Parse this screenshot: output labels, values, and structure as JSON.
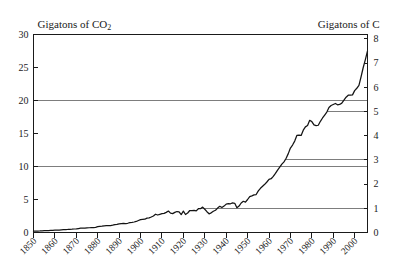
{
  "chart_data": {
    "type": "line",
    "title": "",
    "xlabel": "",
    "ylabel": "Gigatons of CO2",
    "ylabel_right": "Gigatons of C",
    "left_axis": {
      "label": "Gigatons of CO2",
      "unit": "Gigatons of CO2",
      "ticks": [
        0,
        5,
        10,
        15,
        20,
        25,
        30
      ],
      "tick_labels": [
        "0",
        "5",
        "10",
        "15",
        "20",
        "25",
        "30"
      ],
      "ylim": [
        0,
        30
      ]
    },
    "right_axis": {
      "label": "Gigatons of C",
      "unit": "Gigatons of C",
      "ticks": [
        0,
        1,
        2,
        3,
        4,
        5,
        6,
        7,
        8
      ],
      "tick_labels": [
        "0",
        "1",
        "2",
        "3",
        "4",
        "5",
        "6",
        "7",
        "8"
      ],
      "ylim": [
        0,
        8.18
      ]
    },
    "x": {
      "ticks": [
        1850,
        1860,
        1870,
        1880,
        1890,
        1900,
        1910,
        1920,
        1930,
        1940,
        1950,
        1960,
        1970,
        1980,
        1990,
        2000
      ],
      "tick_labels": [
        "1850",
        "1860",
        "1870",
        "1880",
        "1890",
        "1900",
        "1910",
        "1920",
        "1930",
        "1940",
        "1950",
        "1960",
        "1970",
        "1980",
        "1990",
        "2000"
      ],
      "xlim": [
        1850,
        2006
      ]
    },
    "grid": {
      "enabled": true,
      "full_width_levels_co2": [
        10,
        20
      ],
      "partial_levels_carbon": [
        1,
        3,
        5
      ]
    },
    "legend": {
      "entries": [],
      "position": "none"
    },
    "series": [
      {
        "name": "Global CO2 emissions",
        "units": "Gigatons of CO2",
        "points": [
          [
            1850,
            0.2
          ],
          [
            1851,
            0.21
          ],
          [
            1852,
            0.22
          ],
          [
            1853,
            0.23
          ],
          [
            1854,
            0.26
          ],
          [
            1855,
            0.28
          ],
          [
            1856,
            0.29
          ],
          [
            1857,
            0.3
          ],
          [
            1858,
            0.32
          ],
          [
            1859,
            0.33
          ],
          [
            1860,
            0.35
          ],
          [
            1861,
            0.36
          ],
          [
            1862,
            0.37
          ],
          [
            1863,
            0.4
          ],
          [
            1864,
            0.42
          ],
          [
            1865,
            0.44
          ],
          [
            1866,
            0.46
          ],
          [
            1867,
            0.49
          ],
          [
            1868,
            0.5
          ],
          [
            1869,
            0.53
          ],
          [
            1870,
            0.55
          ],
          [
            1871,
            0.6
          ],
          [
            1872,
            0.65
          ],
          [
            1873,
            0.68
          ],
          [
            1874,
            0.66
          ],
          [
            1875,
            0.71
          ],
          [
            1876,
            0.72
          ],
          [
            1877,
            0.74
          ],
          [
            1878,
            0.75
          ],
          [
            1879,
            0.79
          ],
          [
            1880,
            0.88
          ],
          [
            1881,
            0.92
          ],
          [
            1882,
            0.96
          ],
          [
            1883,
            1.02
          ],
          [
            1884,
            1.03
          ],
          [
            1885,
            1.03
          ],
          [
            1886,
            1.05
          ],
          [
            1887,
            1.11
          ],
          [
            1888,
            1.19
          ],
          [
            1889,
            1.22
          ],
          [
            1890,
            1.3
          ],
          [
            1891,
            1.35
          ],
          [
            1892,
            1.37
          ],
          [
            1893,
            1.35
          ],
          [
            1894,
            1.4
          ],
          [
            1895,
            1.48
          ],
          [
            1896,
            1.53
          ],
          [
            1897,
            1.59
          ],
          [
            1898,
            1.67
          ],
          [
            1899,
            1.82
          ],
          [
            1900,
            1.95
          ],
          [
            1901,
            1.98
          ],
          [
            1902,
            2.01
          ],
          [
            1903,
            2.18
          ],
          [
            1904,
            2.21
          ],
          [
            1905,
            2.35
          ],
          [
            1906,
            2.5
          ],
          [
            1907,
            2.77
          ],
          [
            1908,
            2.65
          ],
          [
            1909,
            2.75
          ],
          [
            1910,
            2.85
          ],
          [
            1911,
            2.89
          ],
          [
            1912,
            3.05
          ],
          [
            1913,
            3.25
          ],
          [
            1914,
            2.93
          ],
          [
            1915,
            2.86
          ],
          [
            1916,
            3.05
          ],
          [
            1917,
            3.18
          ],
          [
            1918,
            3.13
          ],
          [
            1919,
            2.71
          ],
          [
            1920,
            3.25
          ],
          [
            1921,
            2.73
          ],
          [
            1922,
            2.95
          ],
          [
            1923,
            3.33
          ],
          [
            1924,
            3.33
          ],
          [
            1925,
            3.35
          ],
          [
            1926,
            3.27
          ],
          [
            1927,
            3.6
          ],
          [
            1928,
            3.6
          ],
          [
            1929,
            3.85
          ],
          [
            1930,
            3.52
          ],
          [
            1931,
            3.15
          ],
          [
            1932,
            2.83
          ],
          [
            1933,
            2.98
          ],
          [
            1934,
            3.22
          ],
          [
            1935,
            3.37
          ],
          [
            1936,
            3.7
          ],
          [
            1937,
            3.97
          ],
          [
            1938,
            3.78
          ],
          [
            1939,
            4.0
          ],
          [
            1940,
            4.3
          ],
          [
            1941,
            4.38
          ],
          [
            1942,
            4.35
          ],
          [
            1943,
            4.48
          ],
          [
            1944,
            4.43
          ],
          [
            1945,
            3.75
          ],
          [
            1946,
            4.0
          ],
          [
            1947,
            4.47
          ],
          [
            1948,
            4.73
          ],
          [
            1949,
            4.6
          ],
          [
            1950,
            5.0
          ],
          [
            1951,
            5.45
          ],
          [
            1952,
            5.55
          ],
          [
            1953,
            5.7
          ],
          [
            1954,
            5.75
          ],
          [
            1955,
            6.3
          ],
          [
            1956,
            6.7
          ],
          [
            1957,
            7.0
          ],
          [
            1958,
            7.3
          ],
          [
            1959,
            7.65
          ],
          [
            1960,
            8.05
          ],
          [
            1961,
            8.15
          ],
          [
            1962,
            8.5
          ],
          [
            1963,
            8.95
          ],
          [
            1964,
            9.45
          ],
          [
            1965,
            9.9
          ],
          [
            1966,
            10.35
          ],
          [
            1967,
            10.7
          ],
          [
            1968,
            11.25
          ],
          [
            1969,
            11.95
          ],
          [
            1970,
            12.8
          ],
          [
            1971,
            13.25
          ],
          [
            1972,
            13.85
          ],
          [
            1973,
            14.7
          ],
          [
            1974,
            14.75
          ],
          [
            1975,
            14.7
          ],
          [
            1976,
            15.5
          ],
          [
            1977,
            16.0
          ],
          [
            1978,
            16.2
          ],
          [
            1979,
            17.0
          ],
          [
            1980,
            16.8
          ],
          [
            1981,
            16.3
          ],
          [
            1982,
            16.2
          ],
          [
            1983,
            16.25
          ],
          [
            1984,
            16.85
          ],
          [
            1985,
            17.35
          ],
          [
            1986,
            17.8
          ],
          [
            1987,
            18.25
          ],
          [
            1988,
            18.95
          ],
          [
            1989,
            19.25
          ],
          [
            1990,
            19.4
          ],
          [
            1991,
            19.55
          ],
          [
            1992,
            19.35
          ],
          [
            1993,
            19.4
          ],
          [
            1994,
            19.6
          ],
          [
            1995,
            20.05
          ],
          [
            1996,
            20.5
          ],
          [
            1997,
            20.8
          ],
          [
            1998,
            20.8
          ],
          [
            1999,
            20.85
          ],
          [
            2000,
            21.5
          ],
          [
            2001,
            21.85
          ],
          [
            2002,
            22.3
          ],
          [
            2003,
            23.6
          ],
          [
            2004,
            25.0
          ],
          [
            2005,
            26.2
          ],
          [
            2006,
            27.5
          ]
        ]
      }
    ],
    "annotations": []
  }
}
